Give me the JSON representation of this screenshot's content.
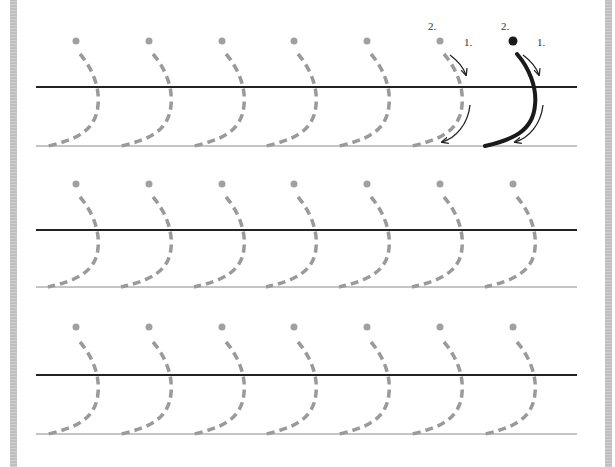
{
  "worksheet": {
    "type": "handwriting-tracing-worksheet",
    "stroke_colors": {
      "guide_dashed": "#9a9a9a",
      "start_dot": "#a0a0a0",
      "example_stroke": "#1a1a1a",
      "baseline_thick": "#222222",
      "baseline_thin": "#8a8a8a",
      "border": "#b5b5b5"
    },
    "example": {
      "step_labels": {
        "dot_step": "2.",
        "stroke_step": "1."
      }
    },
    "rows": [
      {
        "midline_y": 87,
        "baseline_y": 146,
        "dot_y": 41,
        "glyph_count": 7,
        "has_example": true
      },
      {
        "midline_y": 230,
        "baseline_y": 287,
        "dot_y": 184,
        "glyph_count": 7,
        "has_example": false
      },
      {
        "midline_y": 375,
        "baseline_y": 434,
        "dot_y": 327,
        "glyph_count": 7,
        "has_example": false
      }
    ],
    "glyph_x": [
      76,
      149,
      222,
      294,
      367,
      440,
      513
    ]
  }
}
